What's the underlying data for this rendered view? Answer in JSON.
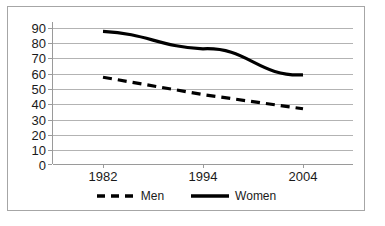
{
  "chart_data": {
    "type": "line",
    "title": "",
    "subtitle": "",
    "xlabel": "",
    "ylabel": "",
    "categories": [
      "1982",
      "1994",
      "2004"
    ],
    "x": [
      1982,
      1994,
      2004
    ],
    "series": [
      {
        "name": "Men",
        "values": [
          55,
          44,
          35
        ],
        "style": "dashed",
        "color": "#000000"
      },
      {
        "name": "Women",
        "values": [
          84,
          73,
          56.5
        ],
        "style": "solid",
        "color": "#000000"
      }
    ],
    "ylim": [
      0,
      90
    ],
    "yticks": [
      0,
      10,
      20,
      30,
      40,
      50,
      60,
      70,
      80,
      90
    ],
    "ytick_labels": [
      "0",
      "10",
      "20",
      "30",
      "40",
      "50",
      "60",
      "70",
      "80",
      "90"
    ],
    "grid": true,
    "grid_axis": "y",
    "legend_position": "bottom-center",
    "legend": [
      "Men",
      "Women"
    ],
    "annotations": []
  },
  "axes": {
    "y_labels": [
      "90",
      "80",
      "70",
      "60",
      "50",
      "40",
      "30",
      "20",
      "10",
      "0"
    ],
    "x_labels": [
      "1982",
      "1994",
      "2004"
    ]
  },
  "legend": {
    "items": [
      {
        "label": "Men",
        "swatch": "dashed-line-swatch"
      },
      {
        "label": "Women",
        "swatch": "solid-line-swatch"
      }
    ]
  },
  "colors": {
    "series_line": "#000000",
    "gridline": "#b3b3b3",
    "axis": "#9a9a9a",
    "frame_border": "#a6a6a6",
    "background": "#ffffff",
    "text": "#1a1a1a"
  }
}
